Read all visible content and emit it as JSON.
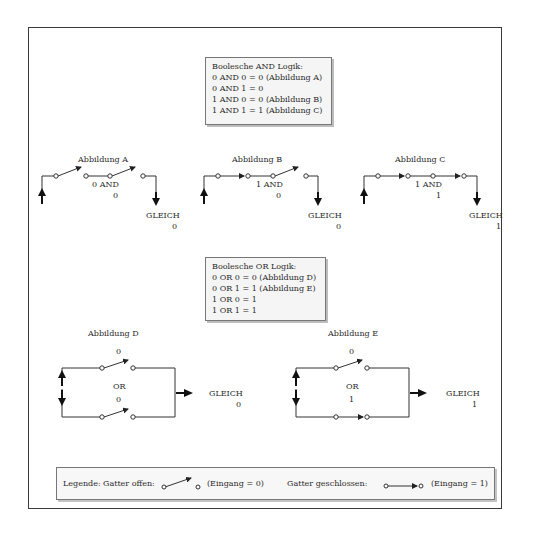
{
  "and_box": {
    "title": "Boolesche AND Logik:",
    "lines": [
      "0 AND 0 = 0 (Abbildung A)",
      "0 AND 1 = 0",
      "1 AND 0 = 0 (Abbildung B)",
      "1 AND 1 = 1 (Abbildung C)"
    ]
  },
  "or_box": {
    "title": "Boolesche OR Logik:",
    "lines": [
      "0 OR 0 = 0 (Abbildung D)",
      "0 OR 1 = 1 (Abbildung E)",
      "1 OR 0 = 1",
      "1 OR 1 = 1"
    ]
  },
  "figures": {
    "a": {
      "title": "Abbildung A",
      "input1": "0 AND",
      "input2": "0",
      "result_label": "GLEICH",
      "result": "0"
    },
    "b": {
      "title": "Abbildung B",
      "input1": "1 AND",
      "input2": "0",
      "result_label": "GLEICH",
      "result": "0"
    },
    "c": {
      "title": "Abbildung C",
      "input1": "1 AND",
      "input2": "1",
      "result_label": "GLEICH",
      "result": "1"
    },
    "d": {
      "title": "Abbildung D",
      "input1": "0",
      "op": "OR",
      "input2": "0",
      "result_label": "GLEICH",
      "result": "0"
    },
    "e": {
      "title": "Abbildung E",
      "input1": "0",
      "op": "OR",
      "input2": "1",
      "result_label": "GLEICH",
      "result": "1"
    }
  },
  "legend": {
    "label": "Legende:",
    "open_label": "Gatter offen:",
    "open_value": "(Eingang = 0)",
    "closed_label": "Gatter geschlossen:",
    "closed_value": "(Eingang = 1)"
  }
}
